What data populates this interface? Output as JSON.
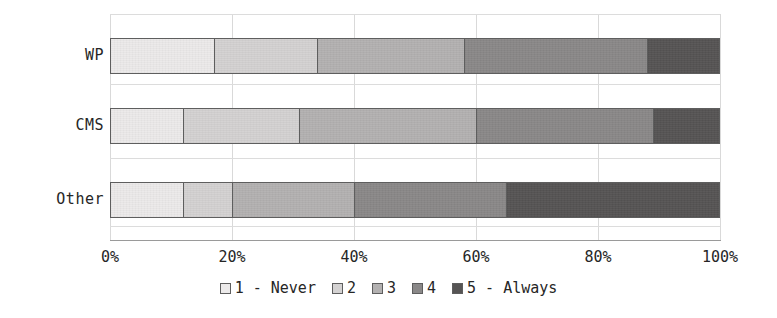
{
  "chart_data": {
    "type": "bar",
    "orientation": "horizontal",
    "stacked": true,
    "stack_mode": "percent",
    "title": "",
    "subtitle": "",
    "xlabel": "",
    "ylabel": "",
    "categories": [
      "WP",
      "CMS",
      "Other"
    ],
    "xlim": [
      0,
      100
    ],
    "xticks": [
      0,
      20,
      40,
      60,
      80,
      100
    ],
    "xtick_labels": [
      "0%",
      "20%",
      "40%",
      "60%",
      "80%",
      "100%"
    ],
    "grid": true,
    "grid_axis": "x",
    "legend_position": "bottom",
    "series": [
      {
        "name": "1 - Never",
        "color": "#eceaea",
        "values": [
          17,
          12,
          12
        ],
        "cumulative_end": [
          17,
          12,
          12
        ]
      },
      {
        "name": "2",
        "color": "#d4d2d2",
        "values": [
          17,
          19,
          8
        ],
        "cumulative_end": [
          34,
          31,
          20
        ]
      },
      {
        "name": "3",
        "color": "#b3b1b1",
        "values": [
          24,
          29,
          20
        ],
        "cumulative_end": [
          58,
          60,
          40
        ]
      },
      {
        "name": "4",
        "color": "#8a8888",
        "values": [
          30,
          29,
          25
        ],
        "cumulative_end": [
          88,
          89,
          65
        ]
      },
      {
        "name": "5 - Always",
        "color": "#565454",
        "values": [
          12,
          11,
          35
        ],
        "cumulative_end": [
          100,
          100,
          100
        ]
      }
    ]
  },
  "legend": {
    "items": [
      {
        "label": "1 - Never",
        "color": "#eceaea"
      },
      {
        "label": "2",
        "color": "#d4d2d2"
      },
      {
        "label": "3",
        "color": "#b3b1b1"
      },
      {
        "label": "4",
        "color": "#8a8888"
      },
      {
        "label": "5 - Always",
        "color": "#565454"
      }
    ]
  },
  "axis": {
    "x_tick_labels": [
      "0%",
      "20%",
      "40%",
      "60%",
      "80%",
      "100%"
    ],
    "y_tick_labels": [
      "WP",
      "CMS",
      "Other"
    ]
  },
  "style": {
    "background": "#ffffff",
    "gridline_color": "#d9d9d9",
    "baseline_color": "#9a9a9a",
    "bar_border_color": "#5e5e5e",
    "text_color": "#262626"
  }
}
